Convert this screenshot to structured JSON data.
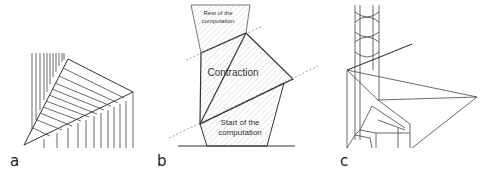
{
  "panels": [
    {
      "id": "a",
      "label": "a"
    },
    {
      "id": "b",
      "label": "b",
      "regions": {
        "top": {
          "line1": "Rest of the",
          "line2": "computation"
        },
        "middle": {
          "text": "Contraction"
        },
        "bottom": {
          "line1": "Start of the",
          "line2": "computation"
        }
      }
    },
    {
      "id": "c",
      "label": "c"
    }
  ],
  "colors": {
    "stroke": "#333333",
    "hatch": "#cfcfcf",
    "dotted": "#888888"
  }
}
